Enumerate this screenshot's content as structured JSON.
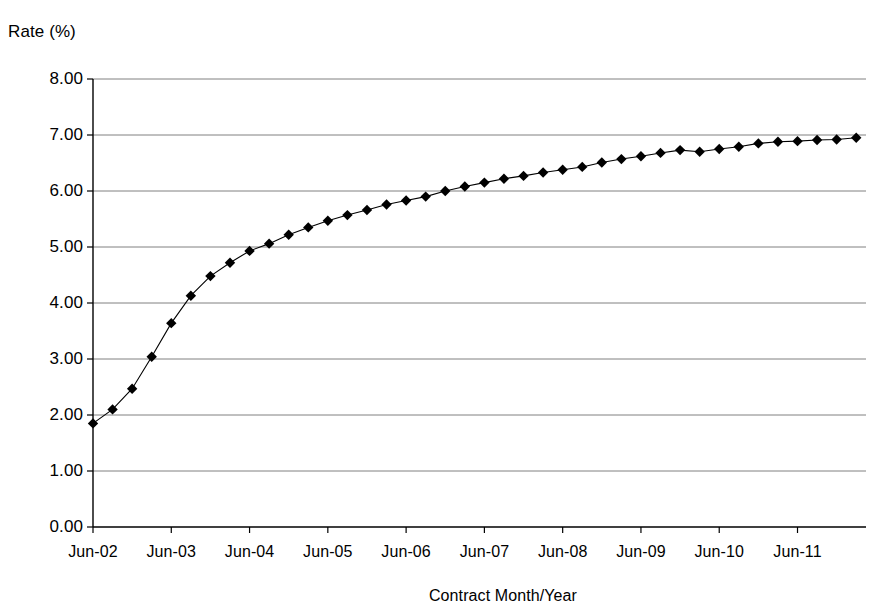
{
  "chart_data": {
    "type": "line",
    "title": "",
    "xlabel": "Contract Month/Year",
    "ylabel": "Rate (%)",
    "ylim": [
      0.0,
      8.0
    ],
    "y_ticks": [
      "0.00",
      "1.00",
      "2.00",
      "3.00",
      "4.00",
      "5.00",
      "6.00",
      "7.00",
      "8.00"
    ],
    "y_tick_values": [
      0,
      1,
      2,
      3,
      4,
      5,
      6,
      7,
      8
    ],
    "x_tick_labels": [
      "Jun-02",
      "Jun-03",
      "Jun-04",
      "Jun-05",
      "Jun-06",
      "Jun-07",
      "Jun-08",
      "Jun-09",
      "Jun-10",
      "Jun-11"
    ],
    "grid": "horizontal",
    "legend": "none",
    "marker": "diamond",
    "marker_color": "#000000",
    "line_color": "#000000",
    "grid_color": "#808080",
    "axis_color": "#000000",
    "points_per_x_tick": 4,
    "x": [
      "Jun-02",
      "Sep-02",
      "Dec-02",
      "Mar-03",
      "Jun-03",
      "Sep-03",
      "Dec-03",
      "Mar-04",
      "Jun-04",
      "Sep-04",
      "Dec-04",
      "Mar-05",
      "Jun-05",
      "Sep-05",
      "Dec-05",
      "Mar-06",
      "Jun-06",
      "Sep-06",
      "Dec-06",
      "Mar-07",
      "Jun-07",
      "Sep-07",
      "Dec-07",
      "Mar-08",
      "Jun-08",
      "Sep-08",
      "Dec-08",
      "Mar-09",
      "Jun-09",
      "Sep-09",
      "Dec-09",
      "Mar-10",
      "Jun-10",
      "Sep-10",
      "Dec-10",
      "Mar-11",
      "Jun-11",
      "Sep-11",
      "Dec-11",
      "Mar-12"
    ],
    "values": [
      1.85,
      2.1,
      2.47,
      3.04,
      3.64,
      4.13,
      4.48,
      4.72,
      4.93,
      5.06,
      5.22,
      5.35,
      5.47,
      5.57,
      5.66,
      5.76,
      5.83,
      5.9,
      6.0,
      6.08,
      6.15,
      6.22,
      6.27,
      6.33,
      6.38,
      6.43,
      6.51,
      6.57,
      6.62,
      6.68,
      6.73,
      6.7,
      6.75,
      6.79,
      6.85,
      6.88,
      6.89,
      6.91,
      6.92,
      6.95
    ]
  }
}
